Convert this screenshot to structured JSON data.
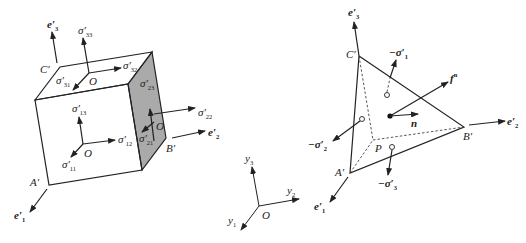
{
  "left_figure": {
    "name": "stress-cube",
    "vertices": {
      "C": "C′",
      "A": "A′",
      "B": "B′"
    },
    "origin_label": "O",
    "axes": [
      {
        "id": "e3",
        "base": "e",
        "prime": "′",
        "sub": "3"
      },
      {
        "id": "e2",
        "base": "e",
        "prime": "′",
        "sub": "2"
      },
      {
        "id": "e1",
        "base": "e",
        "prime": "′",
        "sub": "1"
      }
    ],
    "stresses": [
      {
        "id": "s33",
        "base": "σ",
        "prime": "′",
        "sub": "33"
      },
      {
        "id": "s32",
        "base": "σ",
        "prime": "′",
        "sub": "32"
      },
      {
        "id": "s31",
        "base": "σ",
        "prime": "′",
        "sub": "31"
      },
      {
        "id": "s23",
        "base": "σ",
        "prime": "′",
        "sub": "23"
      },
      {
        "id": "s22",
        "base": "σ",
        "prime": "′",
        "sub": "22"
      },
      {
        "id": "s21",
        "base": "σ",
        "prime": "′",
        "sub": "21"
      },
      {
        "id": "s13",
        "base": "σ",
        "prime": "′",
        "sub": "13"
      },
      {
        "id": "s12",
        "base": "σ",
        "prime": "′",
        "sub": "12"
      },
      {
        "id": "s11",
        "base": "σ",
        "prime": "′",
        "sub": "11"
      }
    ],
    "face_shade": "#aaaaaa"
  },
  "middle_figure": {
    "name": "reference-frame",
    "origin_label": "O",
    "axes": [
      {
        "id": "y3",
        "base": "y",
        "sub": "3"
      },
      {
        "id": "y2",
        "base": "y",
        "sub": "2"
      },
      {
        "id": "y1",
        "base": "y",
        "sub": "1"
      }
    ]
  },
  "right_figure": {
    "name": "cauchy-tetrahedron",
    "vertices": {
      "C": "C′",
      "A": "A′",
      "B": "B′",
      "P": "P"
    },
    "axes": [
      {
        "id": "e3",
        "base": "e",
        "prime": "′",
        "sub": "3"
      },
      {
        "id": "e2",
        "base": "e",
        "prime": "′",
        "sub": "2"
      },
      {
        "id": "e1",
        "base": "e",
        "prime": "′",
        "sub": "1"
      }
    ],
    "tractions": [
      {
        "id": "ms1",
        "base": "−σ",
        "prime": "′",
        "sub": "1"
      },
      {
        "id": "ms2",
        "base": "−σ",
        "prime": "′",
        "sub": "2"
      },
      {
        "id": "ms3",
        "base": "−σ",
        "prime": "′",
        "sub": "3"
      }
    ],
    "force": {
      "base": "f",
      "sup": "n"
    },
    "normal": {
      "base": "n"
    }
  }
}
